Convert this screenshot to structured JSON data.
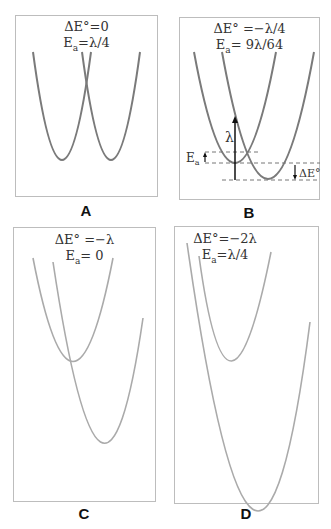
{
  "figure": {
    "panels": [
      {
        "id": "A",
        "label": "A",
        "delta_e_label": "ΔE°=0",
        "ea_main": "E",
        "ea_sub": "a",
        "ea_value": "=λ/4",
        "curve_color": "#7a7a7a"
      },
      {
        "id": "B",
        "label": "B",
        "delta_e_label": "ΔE° =−λ/4",
        "ea_main": "E",
        "ea_sub": "a",
        "ea_value": "= 9λ/64",
        "curve_color": "#7a7a7a",
        "annotations": {
          "lambda": "λ",
          "ea_main": "E",
          "ea_sub": "a",
          "delta_e": "ΔE°"
        }
      },
      {
        "id": "C",
        "label": "C",
        "delta_e_label": "ΔE° =−λ",
        "ea_main": "E",
        "ea_sub": "a",
        "ea_value": "= 0",
        "curve_color": "#aaaaaa"
      },
      {
        "id": "D",
        "label": "D",
        "delta_e_label": "ΔE°=−2λ",
        "ea_main": "E",
        "ea_sub": "a",
        "ea_value": "=λ/4",
        "curve_color": "#aaaaaa"
      }
    ]
  }
}
